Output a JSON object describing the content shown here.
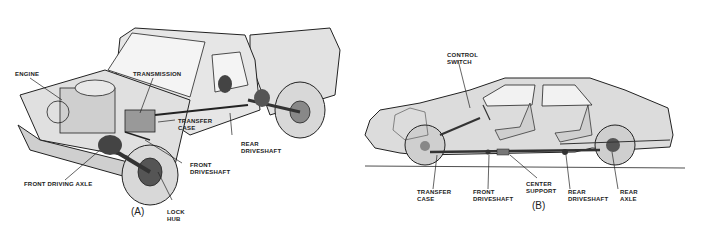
{
  "figures": [
    {
      "id": "A",
      "caption": "(A)",
      "subject": "pickup truck four-wheel-drive layout",
      "labels": {
        "engine": "ENGINE",
        "transmission": "TRANSMISSION",
        "transfer_case": "TRANSFER\nCASE",
        "rear_driveshaft": "REAR\nDRIVESHAFT",
        "front_driveshaft": "FRONT\nDRIVESHAFT",
        "front_driving_axle": "FRONT DRIVING AXLE",
        "lock_hub": "LOCK\nHUB"
      }
    },
    {
      "id": "B",
      "caption": "(B)",
      "subject": "passenger car four-wheel-drive layout",
      "labels": {
        "control_switch": "CONTROL\nSWITCH",
        "transfer_case": "TRANSFER\nCASE",
        "front_driveshaft": "FRONT\nDRIVESHAFT",
        "center_support": "CENTER\nSUPPORT",
        "rear_driveshaft": "REAR\nDRIVESHAFT",
        "rear_axle": "REAR\nAXLE"
      }
    }
  ],
  "colors": {
    "fill": "#dcdcdc",
    "line": "#222222",
    "dark": "#444444",
    "background": "#ffffff"
  }
}
